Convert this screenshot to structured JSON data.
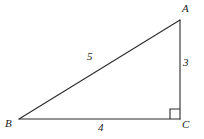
{
  "figure": {
    "kind": "right-triangle-diagram",
    "background_color": "#ffffff",
    "stroke_color": "#2b2b2b",
    "text_color": "#1a1a1a",
    "vertices": [
      {
        "id": "A",
        "label": "A",
        "x": 180,
        "y": 20
      },
      {
        "id": "B",
        "label": "B",
        "x": 19,
        "y": 119
      },
      {
        "id": "C",
        "label": "C",
        "x": 180,
        "y": 119
      }
    ],
    "sides": [
      {
        "id": "AB",
        "from": "A",
        "to": "B",
        "label": "5",
        "role": "hypotenuse"
      },
      {
        "id": "AC",
        "from": "A",
        "to": "C",
        "label": "3",
        "role": "leg-vertical"
      },
      {
        "id": "BC",
        "from": "B",
        "to": "C",
        "label": "4",
        "role": "leg-horizontal"
      }
    ],
    "right_angle": {
      "at": "C",
      "marker": "square",
      "size": 10
    }
  }
}
